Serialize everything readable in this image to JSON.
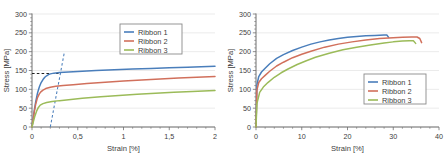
{
  "figure": {
    "panel_count": 2,
    "background": "#ffffff"
  },
  "series_colors": {
    "ribbon1": "#4a7ebb",
    "ribbon2": "#d1705c",
    "ribbon3": "#9bbb59",
    "construction_line": "#4a7ebb",
    "offset_marker": "#222222"
  },
  "chart_data": [
    {
      "id": "left-panel",
      "type": "line",
      "title": "",
      "xlabel": "Strain [%]",
      "ylabel": "Stress [MPa]",
      "xlim": [
        0,
        2
      ],
      "ylim": [
        0,
        300
      ],
      "xticks": [
        0,
        0.5,
        1,
        1.5,
        2
      ],
      "xticklabels": [
        "0",
        "0,5",
        "1",
        "1,5",
        "2"
      ],
      "yticks": [
        0,
        50,
        100,
        150,
        200,
        250,
        300
      ],
      "yticklabels": [
        "0",
        "50",
        "100",
        "150",
        "200",
        "250",
        "300"
      ],
      "grid": "horizontal",
      "legend": {
        "position": "upper-right",
        "entries": [
          "Ribbon 1",
          "Ribbon 2",
          "Ribbon 3"
        ]
      },
      "series": [
        {
          "name": "Ribbon 1",
          "color": "#4a7ebb",
          "x": [
            0,
            0.01,
            0.025,
            0.04,
            0.06,
            0.08,
            0.1,
            0.12,
            0.14,
            0.16,
            0.18,
            0.2,
            0.24,
            0.3,
            0.4,
            0.5,
            0.7,
            0.9,
            1.1,
            1.3,
            1.5,
            1.7,
            1.85,
            2.0
          ],
          "y": [
            0,
            18,
            44,
            66,
            90,
            106,
            118,
            126,
            132,
            136,
            139,
            141,
            143,
            144.5,
            146,
            147.5,
            150,
            152,
            154,
            155.5,
            157,
            158.5,
            160,
            161
          ]
        },
        {
          "name": "Ribbon 2",
          "color": "#d1705c",
          "x": [
            0,
            0.01,
            0.025,
            0.04,
            0.06,
            0.08,
            0.1,
            0.12,
            0.15,
            0.2,
            0.26,
            0.34,
            0.45,
            0.6,
            0.8,
            1.0,
            1.2,
            1.4,
            1.6,
            1.8,
            2.0
          ],
          "y": [
            0,
            16,
            40,
            60,
            78,
            88,
            94,
            98,
            102,
            105.5,
            108,
            110,
            112.5,
            115.5,
            119,
            122,
            125,
            127.5,
            130,
            132,
            134
          ]
        },
        {
          "name": "Ribbon 3",
          "color": "#9bbb59",
          "x": [
            0,
            0.012,
            0.03,
            0.05,
            0.07,
            0.09,
            0.12,
            0.16,
            0.22,
            0.3,
            0.4,
            0.55,
            0.75,
            0.95,
            1.15,
            1.35,
            1.55,
            1.75,
            2.0
          ],
          "y": [
            0,
            12,
            28,
            42,
            52,
            58,
            62,
            65,
            67.5,
            70,
            72.5,
            76,
            80,
            83.5,
            87,
            89.5,
            92,
            94.5,
            97
          ]
        }
      ],
      "annotations": [
        {
          "name": "offset-yield-construction-line",
          "kind": "dashed-line",
          "x": [
            0.2,
            0.355
          ],
          "y": [
            0,
            200
          ],
          "color": "#4a7ebb"
        },
        {
          "name": "yield-stress-marker",
          "kind": "dashed-line",
          "x": [
            0.0,
            0.29
          ],
          "y": [
            142,
            142
          ],
          "color": "#222222"
        }
      ]
    },
    {
      "id": "right-panel",
      "type": "line",
      "title": "",
      "xlabel": "Strain [%]",
      "ylabel": "Stress [MPa]",
      "xlim": [
        0,
        40
      ],
      "ylim": [
        0,
        300
      ],
      "xticks": [
        0,
        10,
        20,
        30,
        40
      ],
      "xticklabels": [
        "0",
        "10",
        "20",
        "30",
        "40"
      ],
      "yticks": [
        0,
        50,
        100,
        150,
        200,
        250,
        300
      ],
      "yticklabels": [
        "0",
        "50",
        "100",
        "150",
        "200",
        "250",
        "300"
      ],
      "grid": "horizontal",
      "legend": {
        "position": "lower-right",
        "entries": [
          "Ribbon 1",
          "Ribbon 2",
          "Ribbon 3"
        ]
      },
      "series": [
        {
          "name": "Ribbon 1",
          "color": "#4a7ebb",
          "x": [
            0,
            0.2,
            0.6,
            1.2,
            2,
            3,
            4.5,
            6,
            8,
            10,
            12,
            14,
            16,
            18,
            20,
            22,
            24,
            26,
            28,
            28.6,
            29.0
          ],
          "y": [
            0,
            112,
            134,
            146,
            156,
            168,
            182,
            192,
            203,
            212,
            220,
            226,
            231,
            235,
            238,
            240,
            242,
            243,
            244,
            244,
            238
          ]
        },
        {
          "name": "Ribbon 2",
          "color": "#d1705c",
          "x": [
            0,
            0.2,
            0.6,
            1.2,
            2,
            3,
            4.5,
            6,
            8,
            10,
            12,
            15,
            18,
            21,
            24,
            27,
            30,
            32,
            34,
            35.2,
            35.8,
            36.2
          ],
          "y": [
            0,
            98,
            118,
            128,
            137,
            148,
            162,
            172,
            184,
            193,
            201,
            212,
            220,
            226,
            231,
            235,
            237,
            238,
            239,
            239,
            235,
            224
          ]
        },
        {
          "name": "Ribbon 3",
          "color": "#9bbb59",
          "x": [
            0,
            0.2,
            0.8,
            1.6,
            2.6,
            4,
            5.5,
            7,
            9,
            11,
            13,
            16,
            19,
            22,
            25,
            28,
            30,
            32,
            33.5,
            34.4,
            34.9
          ],
          "y": [
            0,
            62,
            92,
            106,
            118,
            132,
            144,
            154,
            166,
            176,
            185,
            196,
            205,
            212,
            218,
            223,
            226,
            228,
            229,
            229,
            222
          ]
        }
      ],
      "annotations": []
    }
  ]
}
